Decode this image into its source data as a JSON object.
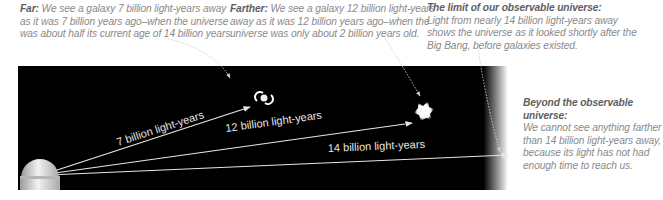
{
  "captions": {
    "far": {
      "title": "Far:",
      "body": "We see a galaxy 7 billion light-years away as it was 7 billion years ago–when the universe was about half its current age of 14 billion years."
    },
    "farther": {
      "title": "Farther:",
      "body": "We see a galaxy 12 billion light-years away as it was 12 billion years ago–when the universe was only about 2 billion years old."
    },
    "limit": {
      "title": "The limit of our observable universe:",
      "body": "Light from nearly 14 billion light-years away shows the universe as it looked shortly after the Big Bang, before galaxies existed."
    },
    "beyond": {
      "title": "Beyond the observable universe:",
      "body": "We cannot see anything farther than 14 billion light-years away, because its light has not had enough time to reach us."
    }
  },
  "diagram": {
    "observer": "observatory-dome",
    "arrows": [
      {
        "label": "7 billion light-years",
        "target": "spiral-galaxy"
      },
      {
        "label": "12 billion light-years",
        "target": "young-galaxy-blob"
      },
      {
        "label": "14 billion light-years",
        "target": "observable-limit"
      }
    ],
    "colors": {
      "space": "#000000",
      "arrow": "#e6e6e6",
      "caption_text": "#8a8a8a",
      "caption_title": "#5e5e5e"
    }
  }
}
